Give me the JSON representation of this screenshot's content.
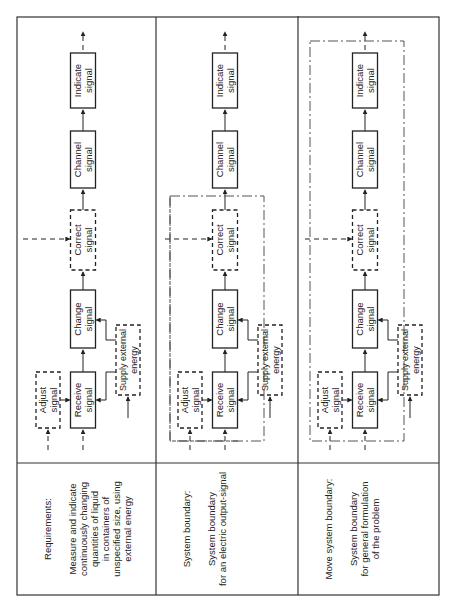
{
  "figure": {
    "orientation": "rotated-90-ccw",
    "columns": [
      {
        "id": "requirements",
        "heading": "Requirements:",
        "description_lines": [
          "Measure and indicate",
          "continuously changing",
          "quantities of liquid",
          "in containers of",
          "unspecified size, using",
          "external energy"
        ],
        "boundary": "none"
      },
      {
        "id": "system-boundary",
        "heading": "System boundary:",
        "description_lines": [
          "System boundary",
          "for an electric output-signal"
        ],
        "boundary": "excludes Channel signal and Indicate signal"
      },
      {
        "id": "move-system-boundary",
        "heading": "Move system boundary:",
        "description_lines": [
          "System boundary",
          "for general formulation",
          "of the problem"
        ],
        "boundary": "encloses all functions"
      }
    ],
    "functions": {
      "indicate": [
        "Indicate",
        "signal"
      ],
      "channel": [
        "Channel",
        "signal"
      ],
      "correct": [
        "Correct",
        "signal"
      ],
      "change": [
        "Change",
        "signal"
      ],
      "receive": [
        "Receive",
        "signal"
      ],
      "adjust": [
        "Adjust",
        "signal"
      ],
      "supply": [
        "Supply external",
        "energy"
      ]
    },
    "function_styles": {
      "indicate": "solid",
      "channel": "solid",
      "correct": "dashed",
      "change": "solid",
      "receive": "solid",
      "adjust": "dashed",
      "supply": "dashed"
    }
  }
}
